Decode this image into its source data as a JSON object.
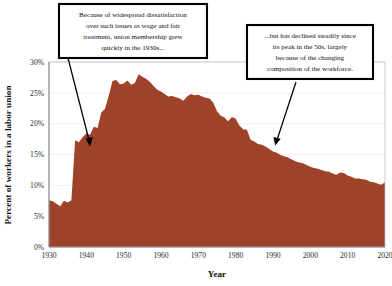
{
  "chart_data": {
    "type": "area",
    "title": "",
    "xlabel": "Year",
    "ylabel": "Percent of workers in a labor union",
    "xlim": [
      1930,
      2020
    ],
    "ylim": [
      0,
      30
    ],
    "grid": true,
    "legend": "none",
    "series_color": "#9e4229",
    "background_color": "#ffffff",
    "y_tick_labels": [
      "0%",
      "5%",
      "10%",
      "15%",
      "20%",
      "25%",
      "30%"
    ],
    "y_tick_values": [
      0,
      5,
      10,
      15,
      20,
      25,
      30
    ],
    "x_tick_labels": [
      "1930",
      "1940",
      "1950",
      "1960",
      "1970",
      "1980",
      "1990",
      "2000",
      "2010",
      "2020"
    ],
    "x_tick_values": [
      1930,
      1940,
      1950,
      1960,
      1970,
      1980,
      1990,
      2000,
      2010,
      2020
    ],
    "series": [
      {
        "name": "Percent of workers in a labor union",
        "x": [
          1930,
          1931,
          1932,
          1933,
          1934,
          1935,
          1936,
          1937,
          1938,
          1939,
          1940,
          1941,
          1942,
          1943,
          1944,
          1945,
          1946,
          1947,
          1948,
          1949,
          1950,
          1951,
          1952,
          1953,
          1954,
          1955,
          1956,
          1957,
          1958,
          1959,
          1960,
          1961,
          1962,
          1963,
          1964,
          1965,
          1966,
          1967,
          1968,
          1969,
          1970,
          1971,
          1972,
          1973,
          1974,
          1975,
          1976,
          1977,
          1978,
          1979,
          1980,
          1981,
          1982,
          1983,
          1984,
          1985,
          1986,
          1987,
          1988,
          1989,
          1990,
          1991,
          1992,
          1993,
          1994,
          1995,
          1996,
          1997,
          1998,
          1999,
          2000,
          2001,
          2002,
          2003,
          2004,
          2005,
          2006,
          2007,
          2008,
          2009,
          2010,
          2011,
          2012,
          2013,
          2014,
          2015,
          2016,
          2017,
          2018,
          2019,
          2020
        ],
        "values": [
          7.6,
          7.4,
          7.0,
          6.6,
          7.5,
          7.2,
          7.6,
          17.3,
          17.0,
          17.8,
          18.4,
          18.2,
          19.5,
          19.3,
          21.8,
          22.4,
          24.5,
          26.9,
          27.1,
          26.4,
          26.5,
          27.0,
          26.3,
          26.6,
          28.0,
          27.6,
          27.3,
          26.8,
          26.1,
          25.5,
          25.2,
          24.8,
          24.4,
          24.5,
          24.3,
          24.1,
          23.7,
          24.4,
          24.8,
          24.6,
          24.7,
          24.4,
          24.2,
          24.1,
          23.4,
          22.0,
          21.3,
          21.0,
          20.4,
          21.1,
          20.8,
          19.7,
          19.1,
          19.0,
          17.4,
          17.1,
          16.7,
          16.6,
          16.3,
          15.9,
          15.5,
          15.3,
          14.9,
          14.7,
          14.5,
          14.2,
          13.9,
          13.7,
          13.6,
          13.3,
          13.0,
          12.8,
          12.7,
          12.5,
          12.3,
          12.2,
          11.9,
          11.7,
          12.1,
          12.0,
          11.6,
          11.4,
          11.1,
          11.1,
          11.0,
          10.9,
          10.6,
          10.5,
          10.3,
          10.1,
          10.5
        ]
      }
    ],
    "annotations": [
      {
        "id": "callout-left",
        "text": "Because of widespread dissatisfaction over such issues as wage and fair treatment, union membership grew quickly in the 1930s...",
        "lines": [
          "Because of widespread dissatisfaction",
          "over such issues as wage and fair",
          "treatment, union membership grew",
          "quickly in the 1930s..."
        ],
        "points_to_year": 1937,
        "points_to_value": 15.5
      },
      {
        "id": "callout-right",
        "text": "...but has declined steadily since its peak in the 50s, largely because of the changing composition of the workforce.",
        "lines": [
          "...but has declined steadily since",
          "its peak in the 50s, largely",
          "because of the changing",
          "composition of the workforce."
        ],
        "points_to_year": 1991,
        "points_to_value": 15.0
      }
    ]
  }
}
